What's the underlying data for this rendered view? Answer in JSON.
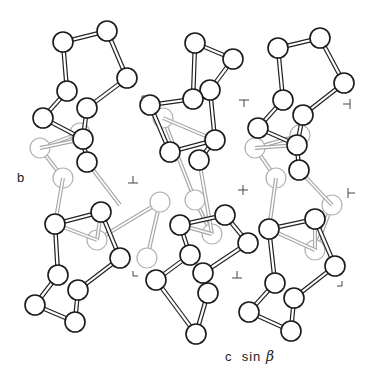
{
  "diagram": {
    "type": "crystal-structure-projection",
    "axes": {
      "vertical_label": "b",
      "horizontal_label_prefix": "c  sin ",
      "horizontal_label_symbol": "β"
    },
    "colors": {
      "front_atom_stroke": "#1a1a1a",
      "back_atom_stroke": "#b0b0b0",
      "front_bond": "#222222",
      "back_bond": "#a8a8a8",
      "atom_fill": "#ffffff",
      "marker": "#444444"
    },
    "atom_radius": 10,
    "atoms_front": [
      [
        63,
        42
      ],
      [
        107,
        31
      ],
      [
        127,
        78
      ],
      [
        87,
        108
      ],
      [
        67,
        91
      ],
      [
        43,
        118
      ],
      [
        83,
        139
      ],
      [
        87,
        162
      ],
      [
        55,
        224
      ],
      [
        101,
        212
      ],
      [
        120,
        258
      ],
      [
        78,
        290
      ],
      [
        58,
        275
      ],
      [
        35,
        305
      ],
      [
        75,
        322
      ],
      [
        195,
        43
      ],
      [
        233,
        59
      ],
      [
        210,
        90
      ],
      [
        193,
        99
      ],
      [
        150,
        105
      ],
      [
        170,
        152
      ],
      [
        215,
        140
      ],
      [
        199,
        160
      ],
      [
        180,
        225
      ],
      [
        225,
        215
      ],
      [
        248,
        243
      ],
      [
        203,
        273
      ],
      [
        190,
        255
      ],
      [
        156,
        280
      ],
      [
        196,
        334
      ],
      [
        208,
        293
      ],
      [
        278,
        48
      ],
      [
        320,
        38
      ],
      [
        344,
        83
      ],
      [
        303,
        115
      ],
      [
        283,
        100
      ],
      [
        258,
        128
      ],
      [
        297,
        145
      ],
      [
        299,
        170
      ],
      [
        269,
        229
      ],
      [
        315,
        219
      ],
      [
        335,
        266
      ],
      [
        294,
        298
      ],
      [
        275,
        283
      ],
      [
        249,
        312
      ],
      [
        291,
        331
      ]
    ],
    "atoms_back": [
      [
        40,
        148
      ],
      [
        63,
        178
      ],
      [
        97,
        240
      ],
      [
        80,
        133
      ],
      [
        163,
        118
      ],
      [
        147,
        258
      ],
      [
        160,
        202
      ],
      [
        195,
        200
      ],
      [
        212,
        234
      ],
      [
        255,
        148
      ],
      [
        276,
        178
      ],
      [
        315,
        250
      ],
      [
        300,
        135
      ],
      [
        332,
        205
      ]
    ],
    "bonds_front": [
      [
        0,
        1
      ],
      [
        1,
        2
      ],
      [
        2,
        3
      ],
      [
        0,
        4
      ],
      [
        4,
        5
      ],
      [
        5,
        6
      ],
      [
        3,
        6
      ],
      [
        6,
        7
      ],
      [
        8,
        9
      ],
      [
        9,
        10
      ],
      [
        10,
        11
      ],
      [
        8,
        12
      ],
      [
        12,
        13
      ],
      [
        13,
        14
      ],
      [
        11,
        14
      ],
      [
        15,
        16
      ],
      [
        16,
        17
      ],
      [
        15,
        18
      ],
      [
        18,
        19
      ],
      [
        19,
        20
      ],
      [
        17,
        21
      ],
      [
        20,
        21
      ],
      [
        21,
        22
      ],
      [
        23,
        24
      ],
      [
        24,
        25
      ],
      [
        25,
        26
      ],
      [
        23,
        27
      ],
      [
        27,
        28
      ],
      [
        28,
        29
      ],
      [
        26,
        30
      ],
      [
        30,
        29
      ],
      [
        31,
        32
      ],
      [
        32,
        33
      ],
      [
        33,
        34
      ],
      [
        31,
        35
      ],
      [
        35,
        36
      ],
      [
        36,
        37
      ],
      [
        34,
        37
      ],
      [
        37,
        38
      ],
      [
        39,
        40
      ],
      [
        40,
        41
      ],
      [
        41,
        42
      ],
      [
        39,
        43
      ],
      [
        43,
        44
      ],
      [
        44,
        45
      ],
      [
        42,
        45
      ]
    ],
    "bonds_back": [
      [
        0,
        1
      ],
      [
        0,
        3
      ],
      [
        2,
        6
      ],
      [
        4,
        7
      ],
      [
        5,
        6
      ],
      [
        7,
        8
      ],
      [
        9,
        10
      ],
      [
        11,
        13
      ],
      [
        12,
        9
      ]
    ],
    "bonds_cross": [
      [
        [
          87,
          162
        ],
        [
          120,
          205
        ]
      ],
      [
        [
          101,
          212
        ],
        [
          97,
          240
        ]
      ],
      [
        [
          55,
          224
        ],
        [
          97,
          240
        ]
      ],
      [
        [
          63,
          178
        ],
        [
          55,
          224
        ]
      ],
      [
        [
          40,
          148
        ],
        [
          83,
          139
        ]
      ],
      [
        [
          170,
          152
        ],
        [
          150,
          105
        ]
      ],
      [
        [
          199,
          160
        ],
        [
          212,
          234
        ]
      ],
      [
        [
          163,
          118
        ],
        [
          215,
          140
        ]
      ],
      [
        [
          180,
          225
        ],
        [
          212,
          234
        ]
      ],
      [
        [
          299,
          170
        ],
        [
          332,
          205
        ]
      ],
      [
        [
          315,
          219
        ],
        [
          315,
          250
        ]
      ],
      [
        [
          269,
          229
        ],
        [
          315,
          250
        ]
      ],
      [
        [
          276,
          178
        ],
        [
          269,
          229
        ]
      ],
      [
        [
          255,
          148
        ],
        [
          297,
          145
        ]
      ]
    ],
    "markers": [
      {
        "x": 142,
        "y": 96,
        "glyph": "corner-tl"
      },
      {
        "x": 244,
        "y": 100,
        "glyph": "tee-down"
      },
      {
        "x": 350,
        "y": 104,
        "glyph": "tee-left"
      },
      {
        "x": 133,
        "y": 183,
        "glyph": "tee-up"
      },
      {
        "x": 243,
        "y": 190,
        "glyph": "plus"
      },
      {
        "x": 348,
        "y": 193,
        "glyph": "tee-right"
      },
      {
        "x": 133,
        "y": 276,
        "glyph": "corner-bl"
      },
      {
        "x": 237,
        "y": 278,
        "glyph": "tee-up"
      },
      {
        "x": 342,
        "y": 286,
        "glyph": "corner-br"
      }
    ]
  }
}
